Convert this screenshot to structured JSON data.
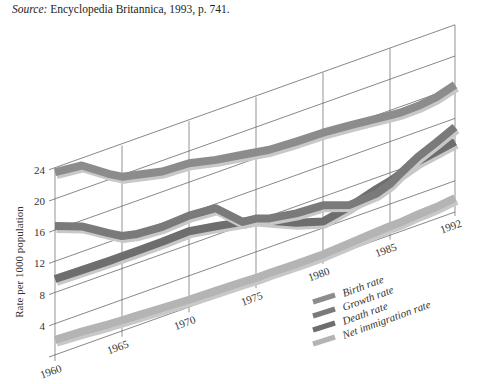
{
  "source": {
    "prefix": "Source:",
    "text": " Encyclopedia Britannica, 1993, p. 741."
  },
  "chart_data": {
    "type": "line",
    "title": "",
    "xlabel": "",
    "ylabel": "Rate per 1000 population",
    "x": [
      1960,
      1962,
      1964,
      1965,
      1966,
      1968,
      1970,
      1972,
      1974,
      1975,
      1976,
      1978,
      1980,
      1982,
      1984,
      1985,
      1986,
      1988,
      1990,
      1992
    ],
    "x_ticks": [
      "1960",
      "1965",
      "1970",
      "1975",
      "1980",
      "1985",
      "1992"
    ],
    "y_ticks": [
      4,
      8,
      12,
      16,
      20,
      24
    ],
    "ylim": [
      0,
      24
    ],
    "grid": true,
    "projection": "oblique-3d",
    "legend_position": "lower right",
    "series": [
      {
        "name": "Birth rate",
        "color": "#8c8c8c",
        "values": [
          23.7,
          23.3,
          21.0,
          20.0,
          19.6,
          18.8,
          18.6,
          17.8,
          17.2,
          16.9,
          16.6,
          16.4,
          16.3,
          16.0,
          15.6,
          15.4,
          15.3,
          15.3,
          15.6,
          16.3
        ]
      },
      {
        "name": "Growth rate",
        "color": "#7a7a7a",
        "values": [
          16.8,
          15.5,
          13.4,
          12.4,
          12.0,
          11.7,
          11.9,
          11.6,
          8.6,
          8.4,
          7.8,
          7.2,
          7.0,
          5.8,
          6.0,
          6.6,
          7.4,
          8.8,
          9.8,
          10.9
        ]
      },
      {
        "name": "Death rate",
        "color": "#6e6e6e",
        "values": [
          10.0,
          9.9,
          9.8,
          9.8,
          9.8,
          9.8,
          9.9,
          9.3,
          8.6,
          8.3,
          7.5,
          6.0,
          4.9,
          5.6,
          6.6,
          7.0,
          7.4,
          8.2,
          8.6,
          9.0
        ]
      },
      {
        "name": "Net immigration rate",
        "color": "#b4b4b4",
        "values": [
          2.2,
          2.0,
          1.7,
          1.6,
          1.5,
          1.3,
          1.1,
          1.0,
          0.9,
          0.8,
          0.8,
          0.7,
          0.7,
          0.9,
          1.1,
          1.2,
          1.2,
          1.4,
          1.5,
          1.8
        ]
      }
    ]
  }
}
